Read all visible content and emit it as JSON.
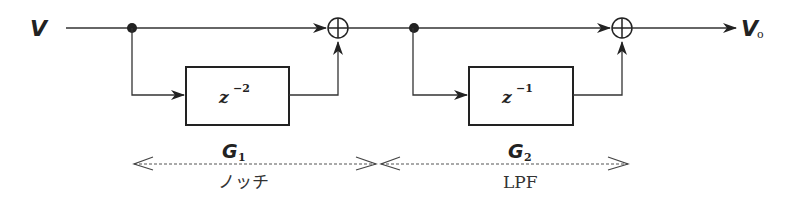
{
  "diagram": {
    "type": "block-diagram",
    "input": {
      "label": "V"
    },
    "output": {
      "label": "V",
      "subscript": "o"
    },
    "stages": [
      {
        "id": "G1",
        "name": "G",
        "subscript": "1",
        "block": {
          "base": "z",
          "exponent": "−2"
        },
        "description": "ノッチ"
      },
      {
        "id": "G2",
        "name": "G",
        "subscript": "2",
        "block": {
          "base": "z",
          "exponent": "−1"
        },
        "description": "LPF"
      }
    ],
    "summing_junction_symbol": "⊕",
    "colors": {
      "line": "#333333",
      "background": "#ffffff"
    }
  }
}
